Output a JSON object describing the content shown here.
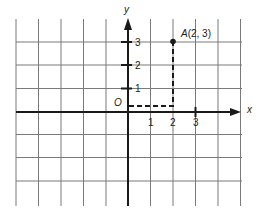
{
  "diagram": {
    "type": "coordinate-plane",
    "axes": {
      "x_label": "x",
      "y_label": "y",
      "origin_label": "O",
      "x_ticks": [
        "1",
        "2",
        "3"
      ],
      "y_ticks": [
        "1",
        "2",
        "3"
      ]
    },
    "point": {
      "name": "A",
      "x": 2,
      "y": 3,
      "label": "A(2, 3)"
    },
    "grid": {
      "columns": 10,
      "rows": 8,
      "unit_px": 22.5
    },
    "colors": {
      "grid": "#7a7a7a",
      "axis": "#1a1a1a",
      "text": "#222222",
      "background": "#ffffff"
    }
  }
}
